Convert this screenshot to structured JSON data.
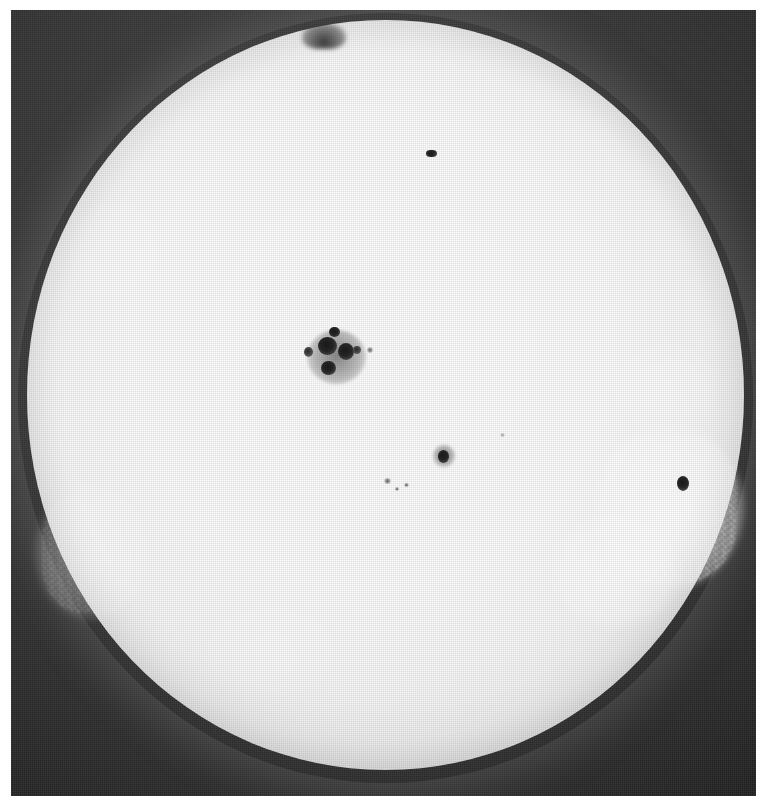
{
  "image": {
    "kind": "astronomical-photograph",
    "subject": "Sun",
    "medium": "black-and-white halftone print",
    "description": "Full-disk white-light photograph of the solar photosphere showing a large sunspot group near disk centre, several smaller spots and pores, and bright faculae near the east and west limbs.",
    "width_px": "771",
    "height_px": "796",
    "orientation": "portrait",
    "border": {
      "color": "#ffffff",
      "left_px": "11",
      "top_px": "10",
      "right_px": "15",
      "bottom_px": "0"
    },
    "colors": {
      "background_sky": "#2b2b2b",
      "sky_light": "#3a3a3a",
      "sky_dark": "#101010",
      "disk_center": "#fcfcfc",
      "disk_limb": "#9a9a9a",
      "umbra": "#1a1a1a",
      "penumbra": "#6f6f6f",
      "faculae": "#ffffff",
      "paper": "#ffffff"
    }
  },
  "disk": {
    "label": "solar-disk",
    "center_x_pct": "50.3",
    "center_y_pct": "49.0",
    "radius_x_pct": "48.1",
    "radius_y_pct": "47.7",
    "limb_darkening": "present",
    "granulation": "visible photospheric granulation / halftone screen texture"
  },
  "features": {
    "top_notch": {
      "label": "limb-notch",
      "x_pct": "42.0",
      "y_pct": "3.3",
      "note": "dark indentation / prominence silhouette on the upper limb"
    },
    "sunspots": [
      {
        "id": "group-main",
        "label": "main-sunspot-group",
        "x_pct": "42.5",
        "y_pct": "44.8",
        "size": "large",
        "note": "complex bipolar group with multiple umbrae and shared penumbra"
      },
      {
        "id": "spot-upper",
        "label": "sunspot-upper",
        "x_pct": "56.2",
        "y_pct": "17.9",
        "size": "small",
        "note": "small elongated spot in the northern hemisphere"
      },
      {
        "id": "spot-center-south",
        "label": "sunspot-central-south",
        "x_pct": "58.0",
        "y_pct": "58.1",
        "size": "medium-small",
        "note": "isolated round spot south-east of disk centre"
      },
      {
        "id": "spot-west-limb",
        "label": "sunspot-west-limb",
        "x_pct": "91.5",
        "y_pct": "61.8",
        "size": "small",
        "note": "foreshortened spot close to the west limb inside a plage"
      },
      {
        "id": "pore-a",
        "label": "pore-left-of-main",
        "x_pct": "39.2",
        "y_pct": "44.2",
        "size": "tiny"
      },
      {
        "id": "pore-b",
        "label": "pore-right-of-main",
        "x_pct": "46.3",
        "y_pct": "44.4",
        "size": "tiny"
      },
      {
        "id": "pore-c",
        "label": "pore-cluster-south",
        "x_pct": "50.2",
        "y_pct": "61.5",
        "size": "tiny"
      },
      {
        "id": "pore-d",
        "label": "pore-south-west",
        "x_pct": "53.0",
        "y_pct": "62.0",
        "size": "tiny"
      }
    ],
    "faculae": [
      {
        "id": "plage-west",
        "label": "faculae-west-limb",
        "x_pct": "88.0",
        "y_pct": "64.0",
        "brightness": "bright",
        "note": "large bright plage region near the west limb"
      },
      {
        "id": "plage-west-lower",
        "label": "faculae-west-lower",
        "x_pct": "82.0",
        "y_pct": "72.5",
        "brightness": "moderate"
      },
      {
        "id": "plage-east",
        "label": "faculae-east-limb",
        "x_pct": "9.0",
        "y_pct": "70.0",
        "brightness": "faint"
      },
      {
        "id": "plage-south",
        "label": "faculae-south",
        "x_pct": "33.0",
        "y_pct": "84.0",
        "brightness": "faint"
      }
    ]
  }
}
